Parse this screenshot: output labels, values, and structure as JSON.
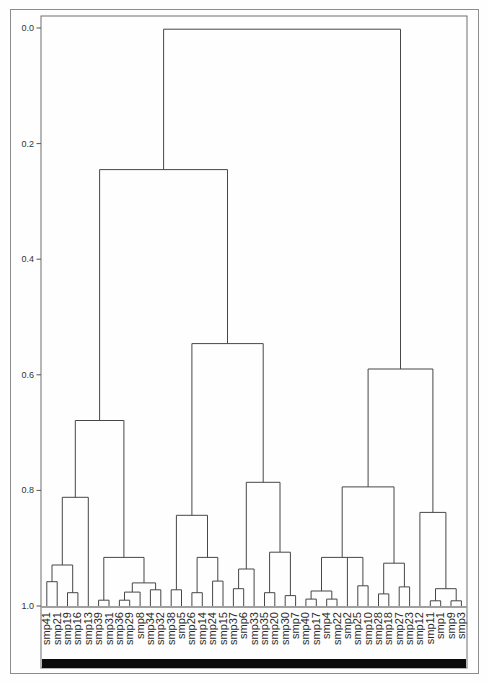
{
  "figure": {
    "background": "#fefefe",
    "outer_border_color": "#8c8c8c",
    "frame_color": "#6f6f6f",
    "line_color": "#474747",
    "baseline_color": "#a0a0a0",
    "cluster_bar_color": "#0b0b0b",
    "leaf_label_color": "#2b2b2b",
    "tick_label_color": "#333333"
  },
  "chart_data": {
    "type": "dendrogram",
    "orientation": "top-root, distance axis inverted (0.0 top, 1.0 at leaves)",
    "title": "",
    "xlabel": "",
    "ylabel": "",
    "ylim": [
      0.0,
      1.0
    ],
    "yticks": [
      0.0,
      0.2,
      0.4,
      0.6,
      0.8,
      1.0
    ],
    "ytick_labels": [
      "0.0",
      "0.2",
      "0.4",
      "0.6",
      "0.8",
      "1.0"
    ],
    "grid": false,
    "legend": false,
    "leaves": [
      "smp41",
      "smp21",
      "smp19",
      "smp16",
      "smp13",
      "smp39",
      "smp31",
      "smp36",
      "smp29",
      "smp8",
      "smp34",
      "smp32",
      "smp38",
      "smp5",
      "smp26",
      "smp14",
      "smp24",
      "smp15",
      "smp37",
      "smp6",
      "smp33",
      "smp35",
      "smp20",
      "smp30",
      "smp7",
      "smp40",
      "smp17",
      "smp4",
      "smp22",
      "smp2",
      "smp25",
      "smp10",
      "smp28",
      "smp18",
      "smp27",
      "smp23",
      "smp12",
      "smp11",
      "smp1",
      "smp9",
      "smp3"
    ],
    "tree": {
      "height": 0.002,
      "children": [
        {
          "height": 0.245,
          "children": [
            {
              "height": 0.679,
              "children": [
                {
                  "height": 0.812,
                  "children": [
                    {
                      "height": 0.929,
                      "children": [
                        {
                          "height": 0.958,
                          "children": [
                            {
                              "label": "smp41"
                            },
                            {
                              "label": "smp21"
                            }
                          ]
                        },
                        {
                          "height": 0.977,
                          "children": [
                            {
                              "label": "smp19"
                            },
                            {
                              "label": "smp16"
                            }
                          ]
                        }
                      ]
                    },
                    {
                      "label": "smp13"
                    }
                  ]
                },
                {
                  "height": 0.916,
                  "children": [
                    {
                      "height": 0.99,
                      "children": [
                        {
                          "label": "smp39"
                        },
                        {
                          "label": "smp31"
                        }
                      ]
                    },
                    {
                      "height": 0.96,
                      "children": [
                        {
                          "height": 0.976,
                          "children": [
                            {
                              "height": 0.99,
                              "children": [
                                {
                                  "label": "smp36"
                                },
                                {
                                  "label": "smp29"
                                }
                              ]
                            },
                            {
                              "label": "smp8"
                            }
                          ]
                        },
                        {
                          "height": 0.972,
                          "children": [
                            {
                              "label": "smp34"
                            },
                            {
                              "label": "smp32"
                            }
                          ]
                        }
                      ]
                    }
                  ]
                }
              ]
            },
            {
              "height": 0.546,
              "children": [
                {
                  "height": 0.843,
                  "children": [
                    {
                      "height": 0.972,
                      "children": [
                        {
                          "label": "smp38"
                        },
                        {
                          "label": "smp5"
                        }
                      ]
                    },
                    {
                      "height": 0.916,
                      "children": [
                        {
                          "height": 0.977,
                          "children": [
                            {
                              "label": "smp26"
                            },
                            {
                              "label": "smp14"
                            }
                          ]
                        },
                        {
                          "height": 0.957,
                          "children": [
                            {
                              "label": "smp24"
                            },
                            {
                              "label": "smp15"
                            }
                          ]
                        }
                      ]
                    }
                  ]
                },
                {
                  "height": 0.786,
                  "children": [
                    {
                      "height": 0.936,
                      "children": [
                        {
                          "height": 0.97,
                          "children": [
                            {
                              "label": "smp37"
                            },
                            {
                              "label": "smp6"
                            }
                          ]
                        },
                        {
                          "label": "smp33"
                        }
                      ]
                    },
                    {
                      "height": 0.907,
                      "children": [
                        {
                          "height": 0.977,
                          "children": [
                            {
                              "label": "smp35"
                            },
                            {
                              "label": "smp20"
                            }
                          ]
                        },
                        {
                          "height": 0.982,
                          "children": [
                            {
                              "label": "smp30"
                            },
                            {
                              "label": "smp7"
                            }
                          ]
                        }
                      ]
                    }
                  ]
                }
              ]
            }
          ]
        },
        {
          "height": 0.59,
          "children": [
            {
              "height": 0.794,
              "children": [
                {
                  "height": 0.916,
                  "children": [
                    {
                      "height": 0.974,
                      "children": [
                        {
                          "height": 0.988,
                          "children": [
                            {
                              "label": "smp40"
                            },
                            {
                              "label": "smp17"
                            }
                          ]
                        },
                        {
                          "height": 0.988,
                          "children": [
                            {
                              "label": "smp4"
                            },
                            {
                              "label": "smp22"
                            }
                          ]
                        }
                      ]
                    },
                    {
                      "label": "smp2"
                    },
                    {
                      "height": 0.965,
                      "children": [
                        {
                          "label": "smp25"
                        },
                        {
                          "label": "smp10"
                        }
                      ]
                    }
                  ]
                },
                {
                  "height": 0.926,
                  "children": [
                    {
                      "height": 0.979,
                      "children": [
                        {
                          "label": "smp28"
                        },
                        {
                          "label": "smp18"
                        }
                      ]
                    },
                    {
                      "height": 0.967,
                      "children": [
                        {
                          "label": "smp27"
                        },
                        {
                          "label": "smp23"
                        }
                      ]
                    }
                  ]
                }
              ]
            },
            {
              "height": 0.838,
              "children": [
                {
                  "label": "smp12"
                },
                {
                  "height": 0.97,
                  "children": [
                    {
                      "height": 0.991,
                      "children": [
                        {
                          "label": "smp11"
                        },
                        {
                          "label": "smp1"
                        }
                      ]
                    },
                    {
                      "height": 0.991,
                      "children": [
                        {
                          "label": "smp9"
                        },
                        {
                          "label": "smp3"
                        }
                      ]
                    }
                  ]
                }
              ]
            }
          ]
        }
      ]
    }
  }
}
